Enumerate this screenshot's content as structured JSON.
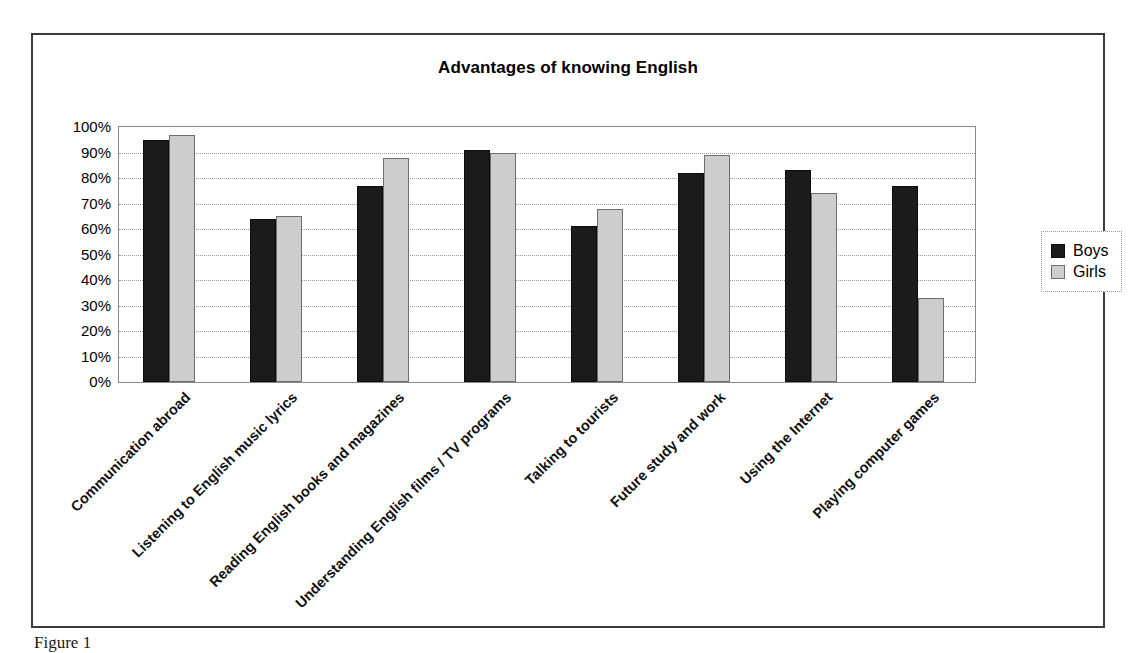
{
  "figure": {
    "caption": "Figure 1"
  },
  "legend": {
    "position": "right",
    "entries": [
      {
        "label": "Boys",
        "color": "#1b1b1b"
      },
      {
        "label": "Girls",
        "color": "#cdcdcd"
      }
    ]
  },
  "chart_data": {
    "type": "bar",
    "title": "Advantages of knowing English",
    "xlabel": "",
    "ylabel": "",
    "ylim": [
      0,
      100
    ],
    "grid": true,
    "legend_position": "right",
    "tick_labels": [
      "0%",
      "10%",
      "20%",
      "30%",
      "40%",
      "50%",
      "60%",
      "70%",
      "80%",
      "90%",
      "100%"
    ],
    "tick_values": [
      0,
      10,
      20,
      30,
      40,
      50,
      60,
      70,
      80,
      90,
      100
    ],
    "categories": [
      "Communication abroad",
      "Listening to English music lyrics",
      "Reading English books and magazines",
      "Understanding English films / TV programs",
      "Talking to tourists",
      "Future study and work",
      "Using the Internet",
      "Playing computer games"
    ],
    "series": [
      {
        "name": "Boys",
        "color": "#1b1b1b",
        "values": [
          95,
          64,
          77,
          91,
          61,
          82,
          83,
          77
        ]
      },
      {
        "name": "Girls",
        "color": "#cdcdcd",
        "values": [
          97,
          65,
          88,
          90,
          68,
          89,
          74,
          33
        ]
      }
    ]
  }
}
